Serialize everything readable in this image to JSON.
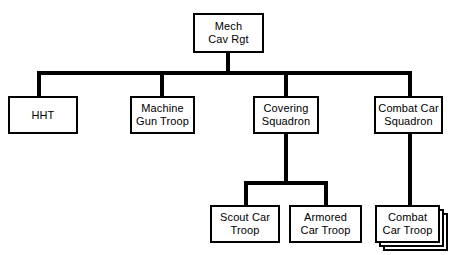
{
  "diagram": {
    "type": "organizational-chart",
    "background_color": "#ffffff",
    "line_color": "#000000",
    "box_fill_color": "#ffffff",
    "box_border_color": "#000000"
  },
  "nodes": {
    "root": {
      "id": "mech-cav-rgt",
      "label": "Mech\nCav Rgt",
      "line1": "Mech",
      "line2": "Cav Rgt",
      "level": 1
    },
    "hht": {
      "id": "hht",
      "label": "HHT",
      "line1": "HHT",
      "line2": "",
      "level": 2
    },
    "machine_gun_troop": {
      "id": "machine-gun-troop",
      "label": "Machine\nGun Troop",
      "line1": "Machine",
      "line2": "Gun Troop",
      "level": 2
    },
    "covering_squadron": {
      "id": "covering-squadron",
      "label": "Covering\nSquadron",
      "line1": "Covering",
      "line2": "Squadron",
      "level": 2
    },
    "combat_car_squadron": {
      "id": "combat-car-squadron",
      "label": "Combat Car\nSquadron",
      "line1": "Combat Car",
      "line2": "Squadron",
      "level": 2
    },
    "scout_car_troop": {
      "id": "scout-car-troop",
      "label": "Scout Car\nTroop",
      "line1": "Scout Car",
      "line2": "Troop",
      "level": 3
    },
    "armored_car_troop": {
      "id": "armored-car-troop",
      "label": "Armored\nCar Troop",
      "line1": "Armored",
      "line2": "Car Troop",
      "level": 3
    },
    "combat_car_troop": {
      "id": "combat-car-troop",
      "label": "Combat\nCar Troop",
      "line1": "Combat",
      "line2": "Car Troop",
      "level": 3,
      "stacked": "true",
      "stack_note": "drawn as stacked boxes indicating multiple identical units"
    }
  },
  "hierarchy": {
    "mech-cav-rgt": [
      "hht",
      "machine-gun-troop",
      "covering-squadron",
      "combat-car-squadron"
    ],
    "covering-squadron": [
      "scout-car-troop",
      "armored-car-troop"
    ],
    "combat-car-squadron": [
      "combat-car-troop"
    ]
  }
}
